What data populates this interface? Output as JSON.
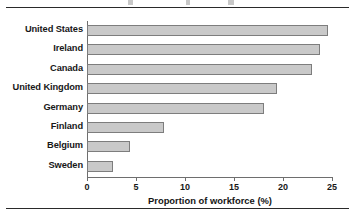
{
  "chart_data": {
    "type": "bar",
    "orientation": "horizontal",
    "title": "",
    "xlabel": "Proportion of workforce (%)",
    "ylabel": "",
    "categories": [
      "United States",
      "Ireland",
      "Canada",
      "United Kingdom",
      "Germany",
      "Finland",
      "Belgium",
      "Sweden"
    ],
    "values": [
      24.6,
      23.8,
      23.0,
      19.4,
      18.1,
      7.9,
      4.4,
      2.7
    ],
    "xlim": [
      0,
      25
    ],
    "xticks": [
      0,
      5,
      10,
      15,
      20,
      25
    ],
    "xtick_labels": [
      "0",
      "5",
      "10",
      "15",
      "20",
      "25"
    ],
    "grid": false,
    "legend": null,
    "bar_fill_color": "#c9c9c9",
    "bar_border_color": "#7d7d7d",
    "axis_color": "#6e6e6e",
    "text_color": "#181818"
  },
  "figure": {
    "top_rule": "",
    "bottom_rule": ""
  }
}
